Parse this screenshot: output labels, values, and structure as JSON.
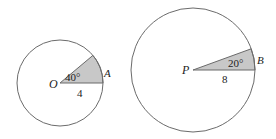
{
  "figures": [
    {
      "id": "circle-O",
      "center_label": "O",
      "point_label": "A",
      "angle_label": "40°",
      "radius_label": "4",
      "angle_deg": 40,
      "radius": 4
    },
    {
      "id": "circle-P",
      "center_label": "P",
      "point_label": "B",
      "angle_label": "20°",
      "radius_label": "8",
      "angle_deg": 20,
      "radius": 8
    }
  ],
  "colors": {
    "stroke": "#6b6b6b",
    "sector_fill": "#c8c8c8",
    "text": "#222222"
  }
}
